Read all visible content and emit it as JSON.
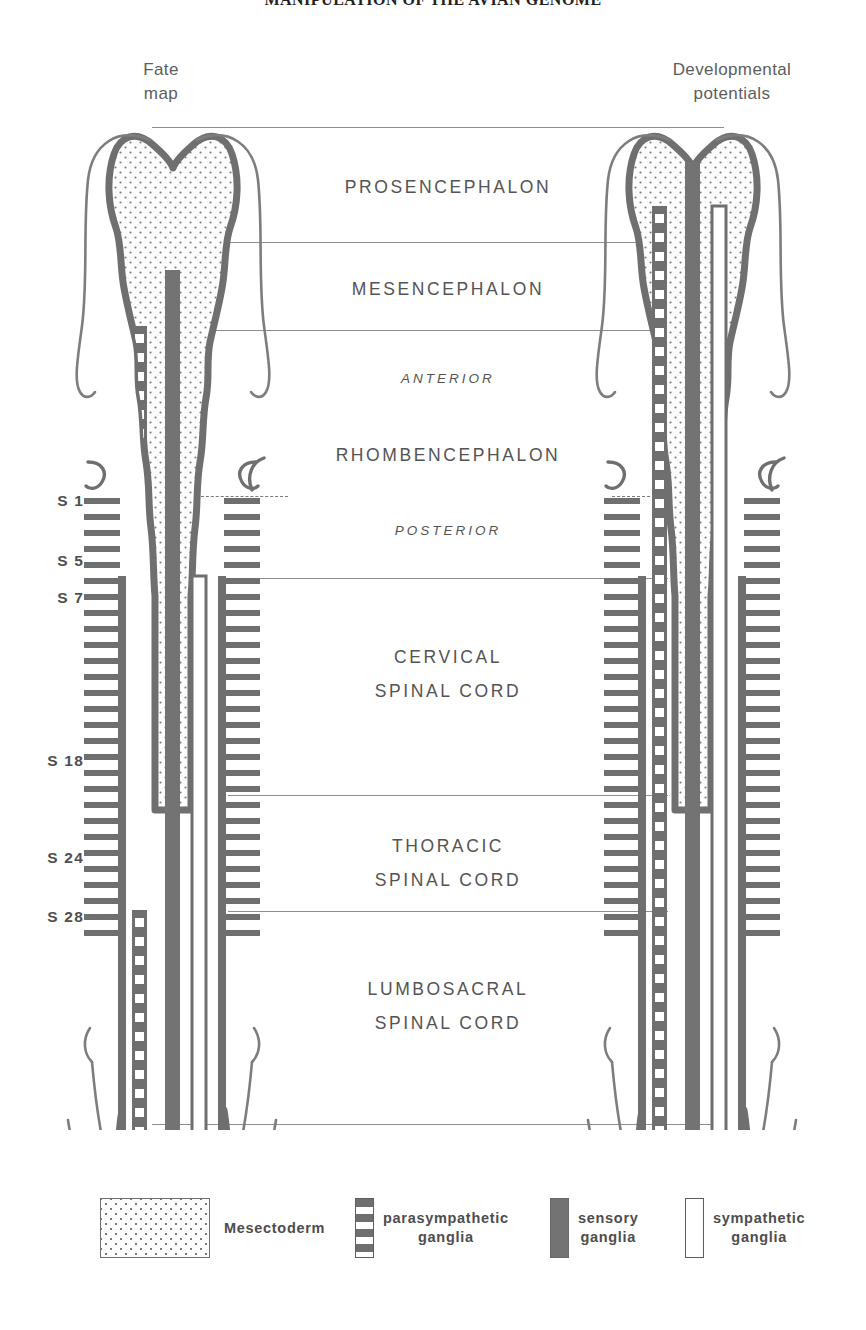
{
  "running_head": "MANIPULATION OF THE AVIAN GENOME",
  "columns": {
    "left": {
      "caption": "Fate\nmap"
    },
    "right": {
      "caption": "Developmental\npotentials"
    }
  },
  "regions": [
    {
      "id": "prosencephalon",
      "label": "PROSENCEPHALON",
      "style": "major"
    },
    {
      "id": "mesencephalon",
      "label": "MESENCEPHALON",
      "style": "major"
    },
    {
      "id": "anterior",
      "label": "ANTERIOR",
      "style": "axis"
    },
    {
      "id": "rhombencephalon",
      "label": "RHOMBENCEPHALON",
      "style": "major"
    },
    {
      "id": "posterior",
      "label": "POSTERIOR",
      "style": "axis"
    },
    {
      "id": "cervical",
      "label": "CERVICAL\nSPINAL CORD",
      "style": "major"
    },
    {
      "id": "thoracic",
      "label": "THORACIC\nSPINAL CORD",
      "style": "major"
    },
    {
      "id": "lumbosacral",
      "label": "LUMBOSACRAL\nSPINAL CORD",
      "style": "major"
    }
  ],
  "somite_labels": [
    {
      "id": "s1",
      "label": "S 1"
    },
    {
      "id": "s5",
      "label": "S 5"
    },
    {
      "id": "s7",
      "label": "S 7"
    },
    {
      "id": "s18",
      "label": "S 18"
    },
    {
      "id": "s24",
      "label": "S 24"
    },
    {
      "id": "s28",
      "label": "S 28"
    }
  ],
  "legend": [
    {
      "id": "mesectoderm",
      "swatch": "mesectoderm-swatch",
      "label": "Mesectoderm"
    },
    {
      "id": "parasympathetic-ganglia",
      "swatch": "parasympathetic-swatch",
      "label": "parasympathetic\nganglia"
    },
    {
      "id": "sensory-ganglia",
      "swatch": "sensory-swatch",
      "label": "sensory\nganglia"
    },
    {
      "id": "sympathetic-ganglia",
      "swatch": "sympathetic-swatch",
      "label": "sympathetic\nganglia"
    }
  ],
  "colors": {
    "outline": "#6f6f6f",
    "stipple": "#7a7a7a",
    "sensory": "#737373",
    "parasympathetic": "#6f6f6f",
    "sympathetic_fill": "#ffffff",
    "divider": "#8e8e8e",
    "text": "#4d4d4d"
  }
}
